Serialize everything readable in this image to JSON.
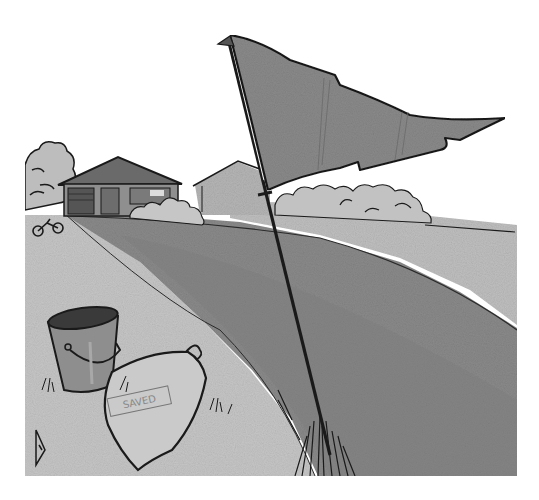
{
  "illustration": {
    "description": "Grayscale pen-and-ink illustration of a torn pennant flag on a pole planted in a lawn, with a metal bucket and a seed bag labelled on a path in the foreground, and houses with shrubs in the background",
    "style": "grayscale ink sketch with halftone wash",
    "colors": {
      "background": "#ffffff",
      "sky": "#ffffff",
      "flag": "#8a8a8a",
      "lawn": "#8c8c8c",
      "lawn_dark": "#7a7a7a",
      "path": "#c4c4c4",
      "distant_field": "#bdbdbd",
      "house_roof": "#6e6e6e",
      "house_wall": "#9a9a9a",
      "bucket": "#8e8e8e",
      "bag": "#c8c8c8",
      "ink": "#1a1a1a"
    },
    "elements": {
      "flag": "torn-pennant-flag",
      "pole": "flag-pole",
      "bucket": "metal-bucket",
      "bag": "seed-bag",
      "bag_label": "SAVED",
      "house_left": "ranch-house",
      "house_right": "distant-house",
      "bicycle": "bicycle",
      "artist_mark": "triangle-signature"
    }
  }
}
